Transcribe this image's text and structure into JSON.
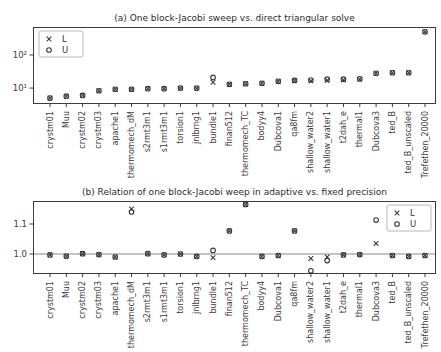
{
  "figure": {
    "background": "#ffffff",
    "marker_color": "#3a3a3a",
    "axis_color": "#3c3c3c",
    "baseline_color": "#8a8a8a",
    "legend_border_color": "#b8b8b8"
  },
  "chart_data": [
    {
      "type": "scatter",
      "title": "(a) One block-Jacobi sweep vs. direct triangular solve",
      "yscale": "log",
      "ylim": [
        3.3,
        700
      ],
      "yticks": [
        10,
        100
      ],
      "ytick_labels": [
        "10¹",
        "10²"
      ],
      "grid": false,
      "legend": {
        "position": "top-left",
        "entries": [
          {
            "marker": "x",
            "label": "L"
          },
          {
            "marker": "o",
            "label": "U"
          }
        ]
      },
      "categories": [
        "crystm01",
        "Muu",
        "crystm02",
        "crystm03",
        "apache1",
        "thermomech_dM",
        "s2rmt3m1",
        "s1rmt3m1",
        "torsion1",
        "jnlbrng1",
        "bundle1",
        "finan512",
        "thermomech_TC",
        "bodyy4",
        "Dubcova1",
        "qa8fm",
        "shallow_water2",
        "shallow_water1",
        "t2dah_e",
        "thermal1",
        "Dubcova3",
        "ted_B",
        "ted_B_unscaled",
        "Trefethen_20000"
      ],
      "series": [
        {
          "name": "L",
          "marker": "x",
          "values": [
            5.0,
            5.7,
            6.0,
            8.3,
            9.2,
            9.2,
            9.6,
            9.6,
            10.0,
            10.0,
            15.0,
            13.0,
            13.5,
            14.0,
            16.0,
            17.0,
            16.5,
            17.0,
            17.5,
            18.5,
            28.0,
            29.0,
            29.0,
            500.0
          ]
        },
        {
          "name": "U",
          "marker": "o",
          "values": [
            5.0,
            5.7,
            6.0,
            8.3,
            9.2,
            9.2,
            9.6,
            9.6,
            10.0,
            10.0,
            21.0,
            13.0,
            13.5,
            14.0,
            16.0,
            17.0,
            17.5,
            18.5,
            18.5,
            19.0,
            28.0,
            29.0,
            29.0,
            500.0
          ]
        }
      ]
    },
    {
      "type": "scatter",
      "title": "(b) Relation of one block-Jacobi weep in adaptive vs. fixed precision",
      "yscale": "linear",
      "ylim": [
        0.9333,
        1.1767
      ],
      "yticks": [
        1.0,
        1.1
      ],
      "ytick_labels": [
        "1.0",
        "1.1"
      ],
      "grid": false,
      "baseline": 1.0,
      "legend": {
        "position": "top-right",
        "entries": [
          {
            "marker": "x",
            "label": "L"
          },
          {
            "marker": "o",
            "label": "U"
          }
        ]
      },
      "categories": [
        "crystm01",
        "Muu",
        "crystm02",
        "crystm03",
        "apache1",
        "thermomech_dM",
        "s2rmt3m1",
        "s1rmt3m1",
        "torsion1",
        "jnlbrng1",
        "bundle1",
        "finan512",
        "thermomech_TC",
        "bodyy4",
        "Dubcova1",
        "qa8fm",
        "shallow_water2",
        "shallow_water1",
        "t2dah_e",
        "thermal1",
        "Dubcova3",
        "ted_B",
        "ted_B_unscaled",
        "Trefethen_20000"
      ],
      "series": [
        {
          "name": "L",
          "marker": "x",
          "values": [
            0.997,
            0.993,
            1.001,
            0.998,
            0.99,
            1.15,
            1.001,
            0.997,
            1.0,
            0.992,
            0.988,
            1.077,
            1.165,
            0.992,
            0.995,
            1.077,
            0.985,
            0.99,
            0.997,
            0.998,
            1.035,
            0.995,
            0.992,
            0.995
          ]
        },
        {
          "name": "U",
          "marker": "o",
          "values": [
            0.997,
            0.993,
            1.001,
            0.998,
            0.99,
            1.14,
            1.001,
            0.997,
            1.0,
            0.992,
            1.012,
            1.077,
            1.165,
            0.992,
            0.995,
            1.077,
            0.944,
            0.978,
            0.997,
            0.998,
            1.113,
            0.995,
            0.992,
            0.995
          ]
        }
      ]
    }
  ]
}
